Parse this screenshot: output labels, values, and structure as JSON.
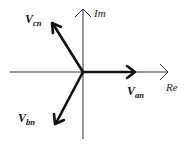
{
  "diagram": {
    "type": "phasor-diagram",
    "axes": {
      "real": {
        "label": "Re"
      },
      "imaginary": {
        "label": "Im"
      }
    },
    "phasors": [
      {
        "id": "an",
        "symbol": "V",
        "subscript": "an",
        "angle_deg": 0
      },
      {
        "id": "bn",
        "symbol": "V",
        "subscript": "bn",
        "angle_deg": -120
      },
      {
        "id": "cn",
        "symbol": "V",
        "subscript": "cn",
        "angle_deg": 120
      }
    ],
    "colors": {
      "phasor": "#111111",
      "axis": "#333333",
      "background": "#ffffff"
    }
  }
}
